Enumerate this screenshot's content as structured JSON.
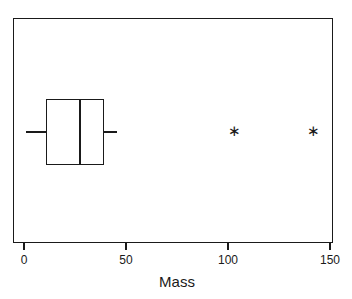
{
  "chart_data": {
    "type": "boxplot",
    "orientation": "horizontal",
    "title": "",
    "xlabel": "Mass",
    "ylabel": "",
    "xlim": [
      -5,
      152
    ],
    "xticks": [
      0,
      50,
      100,
      150
    ],
    "xticklabels": [
      "0",
      "50",
      "100",
      "150"
    ],
    "grid": false,
    "legend": false,
    "frame": true,
    "series": [
      {
        "name": "Mass",
        "min_whisker": 1,
        "q1": 10.8,
        "median": 27,
        "q3": 39,
        "max_whisker": 45.6,
        "outliers": [
          103,
          142
        ],
        "outlier_marker": "*"
      }
    ],
    "colors": {
      "line": "#1a1a1a",
      "box_fill": "transparent",
      "background": "#ffffff"
    }
  },
  "axis": {
    "title": "Mass",
    "ticks": [
      {
        "label": "0",
        "value": 0
      },
      {
        "label": "50",
        "value": 50
      },
      {
        "label": "100",
        "value": 100
      },
      {
        "label": "150",
        "value": 150
      }
    ]
  },
  "outliers": {
    "marker": "∗",
    "points": [
      {
        "label": "103",
        "value": 103
      },
      {
        "label": "142",
        "value": 142
      }
    ]
  }
}
